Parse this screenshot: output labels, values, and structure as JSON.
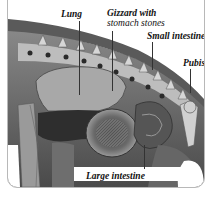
{
  "figure": {
    "top_text_fragment": "...y ........... y",
    "labels": {
      "lung": "Lung",
      "gizzard_line1": "Gizzard with",
      "gizzard_line2": "stomach stones",
      "small_intestine": "Small intestine",
      "pubis": "Pubis",
      "large_intestine": "Large intestine"
    },
    "colors": {
      "border": "#b8b8b8",
      "label_text": "#111111",
      "illustration_dark": "#2a2a2a",
      "illustration_mid": "#7a7a7a",
      "illustration_light": "#c8c8c8"
    }
  }
}
